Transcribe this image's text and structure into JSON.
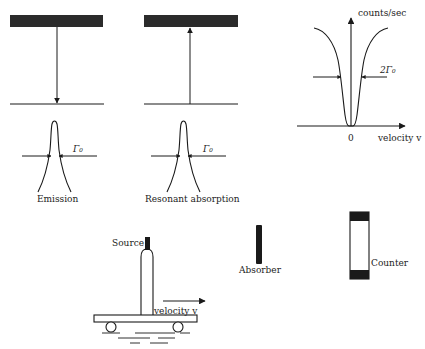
{
  "figure": {
    "emission": {
      "caption": "Emission",
      "linewidth_label": "Γ₀"
    },
    "absorption": {
      "caption": "Resonant absorption",
      "linewidth_label": "Γ₀"
    },
    "spectrum": {
      "y_axis_label": "counts/sec",
      "x_axis_label": "velocity v",
      "origin_label": "0",
      "width_label": "2Γ₀"
    },
    "apparatus": {
      "source_label": "Source",
      "velocity_label": "velocity v",
      "absorber_label": "Absorber",
      "counter_label": "Counter"
    }
  },
  "colors": {
    "ink": "#1a1a1a",
    "bar": "#2b2b2b",
    "background": "#ffffff"
  }
}
